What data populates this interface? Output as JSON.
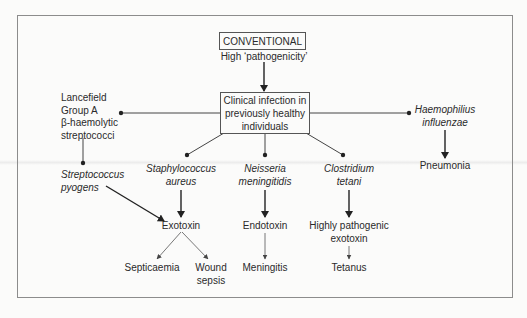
{
  "diagram": {
    "header": {
      "title_box": "CONVENTIONAL",
      "subtitle": "High ‘pathogenicity’"
    },
    "center_box": {
      "lines": [
        "Clinical infection in",
        "previously healthy",
        "individuals"
      ]
    },
    "left_group": {
      "lines": [
        "Lancefield",
        "Group A",
        "β-haemolytic",
        "streptococci"
      ]
    },
    "organisms": [
      {
        "id": "strep",
        "lines": [
          "Streptococcus",
          "pyogens"
        ]
      },
      {
        "id": "staph",
        "lines": [
          "Staphylococcus",
          "aureus"
        ]
      },
      {
        "id": "neisseria",
        "lines": [
          "Neisseria",
          "meningitidis"
        ]
      },
      {
        "id": "clostridium",
        "lines": [
          "Clostridium",
          "tetani"
        ]
      },
      {
        "id": "haemophilus",
        "lines": [
          "Haemophilius",
          "influenzae"
        ]
      }
    ],
    "toxins": {
      "exotoxin": "Exotoxin",
      "endotoxin": "Endotoxin",
      "pathogenic_exotoxin": [
        "Highly pathogenic",
        "exotoxin"
      ]
    },
    "outcomes": {
      "septicaemia": "Septicaemia",
      "wound_sepsis": [
        "Wound",
        "sepsis"
      ],
      "meningitis": "Meningitis",
      "tetanus": "Tetanus",
      "pneumonia": "Pneumonia"
    },
    "colors": {
      "line": "#333333",
      "frame": "#8c8c8c",
      "background": "#fbfbfa"
    }
  }
}
